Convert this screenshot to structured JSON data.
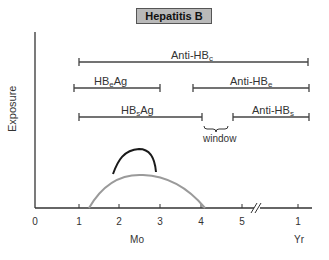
{
  "title": "Hepatitis B",
  "y_axis_label": "Exposure",
  "x_axis": {
    "months_label": "Mo",
    "year_label": "Yr",
    "ticks": [
      {
        "label": "0",
        "x": 35
      },
      {
        "label": "1",
        "x": 79
      },
      {
        "label": "2",
        "x": 119
      },
      {
        "label": "3",
        "x": 160
      },
      {
        "label": "4",
        "x": 201
      },
      {
        "label": "5",
        "x": 242
      },
      {
        "label": "1",
        "x": 298
      }
    ],
    "break_marker": "//"
  },
  "markers": [
    {
      "name": "anti-hbc",
      "base": "Anti-HB",
      "sub": "c",
      "start_mo": 1,
      "end": "1 Yr+",
      "x1": 79,
      "x2": 308,
      "y": 62
    },
    {
      "name": "hbeag",
      "base": "HB",
      "sub": "e",
      "suffix": "Ag",
      "start_mo": 0.9,
      "end_mo": 3,
      "x1": 74,
      "x2": 160,
      "y": 88
    },
    {
      "name": "anti-hbe",
      "base": "Anti-HB",
      "sub": "e",
      "start_mo": 3.8,
      "end": "1 Yr+",
      "x1": 193,
      "x2": 309,
      "y": 88
    },
    {
      "name": "hbsag",
      "base": "HB",
      "sub": "s",
      "suffix": "Ag",
      "start_mo": 1,
      "end_mo": 4,
      "x1": 79,
      "x2": 202,
      "y": 117
    },
    {
      "name": "anti-hbs",
      "base": "Anti-HB",
      "sub": "s",
      "start_mo": 4.8,
      "end": "1 Yr+",
      "x1": 233,
      "x2": 309,
      "y": 117
    }
  ],
  "window_label": "window",
  "curves": [
    {
      "name": "symptoms-curve",
      "color": "#1a1a1a",
      "start_mo": 1.9,
      "peak_mo": 2.5,
      "end_mo": 2.9
    },
    {
      "name": "alt-curve",
      "color": "#9a9a9a",
      "start_mo": 1.2,
      "peak_mo": 2.6,
      "end_mo": 4.1
    }
  ],
  "colors": {
    "axis": "#333333",
    "bars": "#444444",
    "title_bg": "#b9b9b9"
  }
}
